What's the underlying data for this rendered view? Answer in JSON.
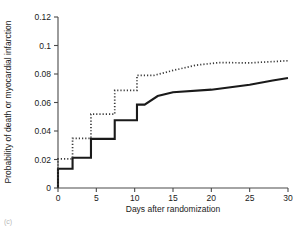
{
  "chart_data": {
    "type": "line",
    "title": "",
    "xlabel": "Days after randomization",
    "ylabel": "Probability of death or myocardial infarction",
    "xlim": [
      0,
      30
    ],
    "ylim": [
      0,
      0.12
    ],
    "xticks": [
      0,
      5,
      10,
      15,
      20,
      25,
      30
    ],
    "xtick_labels": [
      "0",
      "5",
      "10",
      "15",
      "20",
      "25",
      "30"
    ],
    "yticks": [
      0,
      0.02,
      0.04,
      0.06,
      0.08,
      0.1,
      0.12
    ],
    "ytick_labels": [
      "0",
      "0.02",
      "0.04",
      "0.06",
      "0.08",
      "0.1",
      "0.12"
    ],
    "grid": false,
    "legend": null,
    "series": [
      {
        "name": "solid-curve",
        "style": "solid",
        "color": "#1a1a1a",
        "step": true,
        "points": [
          [
            0,
            0.0
          ],
          [
            0,
            0.0135
          ],
          [
            1.9,
            0.0135
          ],
          [
            1.9,
            0.0212
          ],
          [
            4.3,
            0.0212
          ],
          [
            4.3,
            0.0345
          ],
          [
            7.4,
            0.0345
          ],
          [
            7.4,
            0.0475
          ],
          [
            10.3,
            0.0475
          ],
          [
            10.3,
            0.0585
          ],
          [
            11.3,
            0.0585
          ],
          [
            13.0,
            0.0645
          ],
          [
            15.0,
            0.0672
          ],
          [
            20.0,
            0.069
          ],
          [
            25.0,
            0.0725
          ],
          [
            28.0,
            0.0755
          ],
          [
            30.0,
            0.0772
          ]
        ]
      },
      {
        "name": "dotted-curve",
        "style": "dotted",
        "color": "#3a3a3a",
        "step": true,
        "points": [
          [
            0,
            0.0
          ],
          [
            0,
            0.0205
          ],
          [
            1.9,
            0.0205
          ],
          [
            1.9,
            0.0348
          ],
          [
            4.3,
            0.0348
          ],
          [
            4.3,
            0.0518
          ],
          [
            7.4,
            0.0518
          ],
          [
            7.4,
            0.0685
          ],
          [
            10.3,
            0.0685
          ],
          [
            10.3,
            0.079
          ],
          [
            12.5,
            0.079
          ],
          [
            15.0,
            0.0825
          ],
          [
            18.0,
            0.0862
          ],
          [
            21.0,
            0.088
          ],
          [
            25.0,
            0.0878
          ],
          [
            30.0,
            0.0893
          ]
        ]
      }
    ]
  },
  "corner": {
    "mark": "(c)"
  }
}
